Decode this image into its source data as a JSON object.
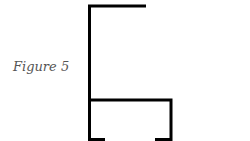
{
  "figure": {
    "caption": "Figure 5",
    "stroke_color": "#000000",
    "caption_color": "#555555",
    "shape": "profile-outline"
  }
}
